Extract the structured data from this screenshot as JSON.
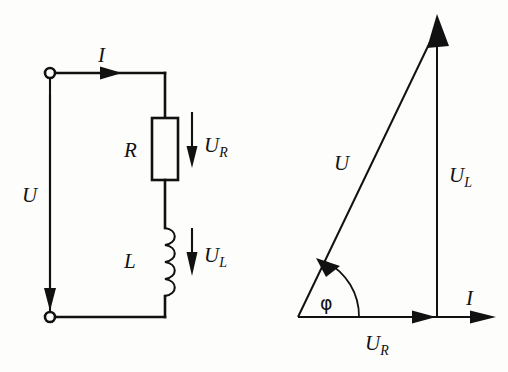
{
  "figure": {
    "background_color": "#fdfdfc",
    "ink_color": "#111111"
  },
  "circuit": {
    "name": "rl-series-circuit",
    "labels": {
      "current": "I",
      "source_voltage": "U",
      "resistor": "R",
      "resistor_voltage_base": "U",
      "resistor_voltage_sub": "R",
      "inductor": "L",
      "inductor_voltage_base": "U",
      "inductor_voltage_sub": "L"
    },
    "components": [
      {
        "name": "resistor",
        "symbol": "rectangle",
        "label": "R",
        "voltage": "UR"
      },
      {
        "name": "inductor",
        "symbol": "coil",
        "label": "L",
        "voltage": "UL"
      }
    ],
    "terminals": [
      {
        "name": "terminal-top-left",
        "shape": "open-circle"
      },
      {
        "name": "terminal-bottom-left",
        "shape": "open-circle"
      }
    ]
  },
  "phasor": {
    "name": "phasor-diagram",
    "labels": {
      "total_voltage": "U",
      "inductor_voltage_base": "U",
      "inductor_voltage_sub": "L",
      "resistor_voltage_base": "U",
      "resistor_voltage_sub": "R",
      "current": "I",
      "phase_angle": "φ"
    },
    "vectors": [
      {
        "name": "UR",
        "direction": "horizontal-right",
        "label": "UR"
      },
      {
        "name": "UL",
        "direction": "vertical-up",
        "label": "UL"
      },
      {
        "name": "U",
        "direction": "diagonal-up-right",
        "label": "U"
      },
      {
        "name": "I",
        "direction": "horizontal-right",
        "label": "I"
      }
    ],
    "angle_marker": {
      "name": "phi-arc",
      "label": "φ"
    }
  }
}
